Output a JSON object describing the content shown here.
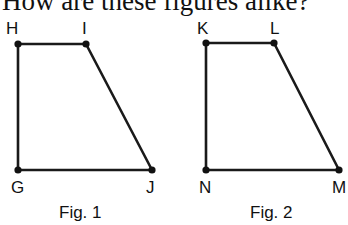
{
  "question": "How are these figures alike?",
  "figures": [
    {
      "caption": "Fig. 1",
      "vertices": {
        "H": {
          "label": "H",
          "x": 18,
          "y": 44
        },
        "I": {
          "label": "I",
          "x": 86,
          "y": 44
        },
        "J": {
          "label": "J",
          "x": 152,
          "y": 170
        },
        "G": {
          "label": "G",
          "x": 18,
          "y": 170
        }
      }
    },
    {
      "caption": "Fig. 2",
      "vertices": {
        "K": {
          "label": "K",
          "x": 206,
          "y": 43
        },
        "L": {
          "label": "L",
          "x": 274,
          "y": 43
        },
        "M": {
          "label": "M",
          "x": 339,
          "y": 170
        },
        "N": {
          "label": "N",
          "x": 206,
          "y": 170
        }
      }
    }
  ]
}
